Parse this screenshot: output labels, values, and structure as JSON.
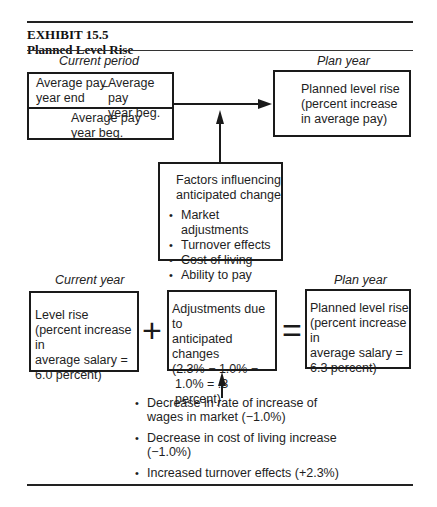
{
  "exhibit": {
    "number": "EXHIBIT 15.5",
    "title": "Planned Level Rise"
  },
  "top_section": {
    "left_caption": "Current period",
    "right_caption": "Plan year",
    "formula_box": {
      "numerator_left": [
        "Average pay",
        "year end"
      ],
      "operator": "−",
      "numerator_right": [
        "Average pay",
        "year beg."
      ],
      "denominator": [
        "Average pay",
        "year beg."
      ]
    },
    "result_box": [
      "Planned level rise",
      "(percent increase",
      "in average pay)"
    ],
    "factors_box": {
      "heading": [
        "Factors influencing",
        "anticipated change"
      ],
      "items": [
        "Market adjustments",
        "Turnover effects",
        "Cost of living",
        "Ability to pay"
      ]
    }
  },
  "bottom_section": {
    "left_caption": "Current year",
    "right_caption": "Plan year",
    "level_rise_box": [
      "Level rise",
      "(percent increase in",
      "average salary =",
      "6.0 percent)"
    ],
    "plus": "+",
    "adjustments_box": [
      "Adjustments due to",
      "anticipated changes",
      "(2.3% − 1.0% −",
      "1.0% =  .3 percent)"
    ],
    "equals": "=",
    "planned_box": [
      "Planned level rise",
      "(percent increase in",
      "average salary =",
      "6.3 percent)"
    ],
    "adjustment_items": [
      [
        "Decrease in rate of increase of",
        "wages in market (−1.0%)"
      ],
      [
        "Decrease in cost of living increase",
        "(−1.0%)"
      ],
      [
        "Increased turnover effects (+2.3%)"
      ]
    ]
  }
}
